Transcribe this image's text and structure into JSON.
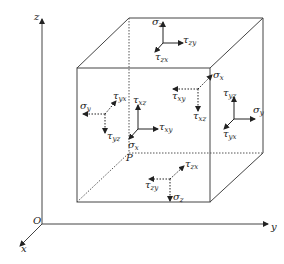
{
  "diagram": {
    "axes": {
      "origin": "O",
      "x": "x",
      "y": "y",
      "z": "z"
    },
    "point": "P",
    "colors": {
      "line": "#333333",
      "background": "#ffffff"
    },
    "faces": [
      {
        "face": "top",
        "normal": {
          "sym": "σ",
          "sub": "z"
        },
        "shear1": {
          "sym": "τ",
          "sub": "zy"
        },
        "shear2": {
          "sym": "τ",
          "sub": "zx"
        }
      },
      {
        "face": "left-back",
        "normal": {
          "sym": "σ",
          "sub": "y"
        },
        "shear1": {
          "sym": "τ",
          "sub": "yx"
        },
        "shear2": {
          "sym": "τ",
          "sub": "yz"
        }
      },
      {
        "face": "front",
        "normal": {
          "sym": "σ",
          "sub": "x"
        },
        "shear1": {
          "sym": "τ",
          "sub": "xz"
        },
        "shear2": {
          "sym": "τ",
          "sub": "xy"
        }
      },
      {
        "face": "back",
        "normal": {
          "sym": "σ",
          "sub": "x"
        },
        "shear1": {
          "sym": "τ",
          "sub": "xy"
        },
        "shear2": {
          "sym": "τ",
          "sub": "xz"
        }
      },
      {
        "face": "right",
        "normal": {
          "sym": "σ",
          "sub": "y"
        },
        "shear1": {
          "sym": "τ",
          "sub": "yz"
        },
        "shear2": {
          "sym": "τ",
          "sub": "yx"
        }
      },
      {
        "face": "bottom",
        "normal": {
          "sym": "σ",
          "sub": "z"
        },
        "shear1": {
          "sym": "τ",
          "sub": "zy"
        },
        "shear2": {
          "sym": "τ",
          "sub": "zx"
        }
      }
    ]
  }
}
